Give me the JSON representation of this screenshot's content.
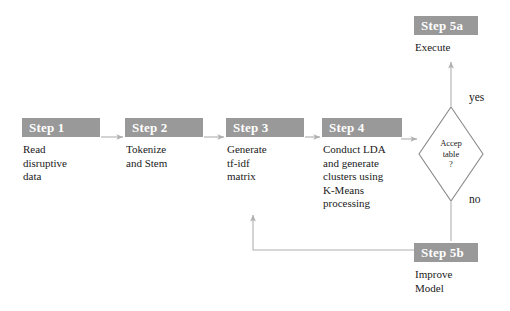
{
  "diagram": {
    "accent_color": "#999999",
    "header_text_color": "#ffffff",
    "body_text_color": "#1a1a1a",
    "connector_color": "#b0b0b0",
    "background": "#ffffff"
  },
  "nodes": [
    {
      "id": "step1",
      "header": "Step 1",
      "body": "Read\ndisruptive\ndata",
      "x": 22,
      "y": 118,
      "width": 78,
      "shape": "process"
    },
    {
      "id": "step2",
      "header": "Step 2",
      "body": "Tokenize\nand Stem",
      "x": 125,
      "y": 118,
      "width": 78,
      "shape": "process"
    },
    {
      "id": "step3",
      "header": "Step 3",
      "body": "Generate\ntf-idf\nmatrix",
      "x": 226,
      "y": 118,
      "width": 78,
      "shape": "process"
    },
    {
      "id": "step4",
      "header": "Step 4",
      "body": "Conduct LDA\nand generate\nclusters using\nK-Means\nprocessing",
      "x": 322,
      "y": 118,
      "width": 78,
      "shape": "process"
    },
    {
      "id": "step5a",
      "header": "Step 5a",
      "body": "Execute",
      "x": 414,
      "y": 16,
      "width": 64,
      "shape": "process"
    },
    {
      "id": "step5b",
      "header": "Step 5b",
      "body": "Improve\nModel",
      "x": 414,
      "y": 243,
      "width": 64,
      "shape": "process"
    }
  ],
  "decision": {
    "id": "acceptable",
    "text": "Accep\ntable\n?",
    "center_x": 451,
    "center_y": 154,
    "half_width": 33,
    "half_height": 48,
    "stroke": "#8a8a8a"
  },
  "edge_labels": [
    {
      "id": "yes",
      "text": "yes",
      "x": 469,
      "y": 91
    },
    {
      "id": "no",
      "text": "no",
      "x": 469,
      "y": 193
    }
  ],
  "connectors": [
    {
      "id": "step1-to-step2",
      "from": "step1",
      "to": "step2"
    },
    {
      "id": "step2-to-step3",
      "from": "step2",
      "to": "step3"
    },
    {
      "id": "step3-to-step4",
      "from": "step3",
      "to": "step4"
    },
    {
      "id": "step4-to-decision",
      "from": "step4",
      "to": "acceptable"
    },
    {
      "id": "decision-yes-to-step5a",
      "from": "acceptable",
      "to": "step5a",
      "label": "yes"
    },
    {
      "id": "decision-no-to-step5b",
      "from": "acceptable",
      "to": "step5b",
      "label": "no"
    },
    {
      "id": "step5b-feedback-to-step4",
      "from": "step5b",
      "to": "step4"
    }
  ]
}
